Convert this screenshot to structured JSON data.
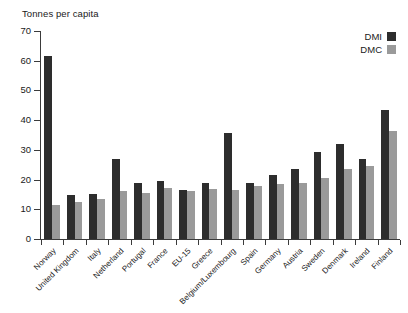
{
  "chart_data": {
    "type": "bar",
    "title": "",
    "ylabel": "Tonnes per capita",
    "xlabel": "",
    "ylim": [
      0,
      70
    ],
    "yticks": [
      0,
      10,
      20,
      30,
      40,
      50,
      60,
      70
    ],
    "grid": false,
    "legend_position": "top-right",
    "categories": [
      "Norway",
      "United Kingdom",
      "Italy",
      "Netherland",
      "Portugal",
      "France",
      "EU-15",
      "Greece",
      "Belgium/Luxembourg",
      "Spain",
      "Germany",
      "Austria",
      "Sweden",
      "Denmark",
      "Ireland",
      "Finland"
    ],
    "series": [
      {
        "name": "DMI",
        "color": "#2d2d2d",
        "values": [
          61.5,
          14.8,
          15.2,
          27.0,
          18.8,
          19.5,
          16.5,
          18.8,
          35.8,
          19.0,
          21.5,
          23.5,
          29.2,
          32.0,
          27.0,
          43.5
        ]
      },
      {
        "name": "DMC",
        "color": "#9a9a9a",
        "values": [
          11.5,
          12.5,
          13.5,
          16.0,
          15.5,
          17.2,
          16.0,
          16.8,
          16.5,
          18.0,
          18.5,
          19.0,
          20.5,
          23.5,
          24.5,
          36.5
        ]
      }
    ]
  },
  "legend": {
    "items": [
      {
        "label": "DMI",
        "color": "#2d2d2d"
      },
      {
        "label": "DMC",
        "color": "#9a9a9a"
      }
    ]
  },
  "source_note": ""
}
